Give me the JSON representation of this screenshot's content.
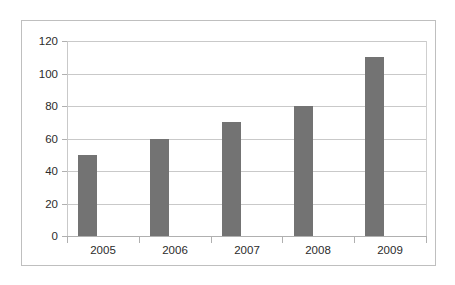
{
  "chart_data": {
    "type": "bar",
    "title": "",
    "subtitle": "",
    "xlabel": "",
    "ylabel": "",
    "categories": [
      "2005",
      "2006",
      "2007",
      "2008",
      "2009"
    ],
    "values": [
      50,
      60,
      70,
      80,
      110
    ],
    "series": [
      {
        "name": "Series 1",
        "values": [
          50,
          60,
          70,
          80,
          110
        ]
      }
    ],
    "ylim": [
      0,
      120
    ],
    "y_ticks": [
      "0",
      "20",
      "40",
      "60",
      "80",
      "100",
      "120"
    ],
    "y_tick_values": [
      0,
      20,
      40,
      60,
      80,
      100,
      120
    ],
    "grid": "horizontal",
    "legend": "none",
    "annotations": [],
    "colors": {
      "bar": "#737373",
      "gridline": "#c9c9c9",
      "axis": "#b0b0b0",
      "frame": "#bfbfbf",
      "background": "#ffffff",
      "text": "#2b2b2b"
    }
  }
}
